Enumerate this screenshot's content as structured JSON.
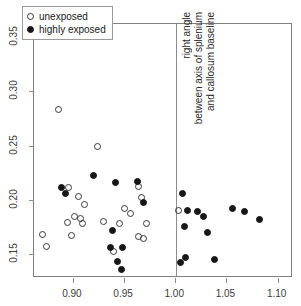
{
  "chart_data": {
    "type": "scatter",
    "title": "",
    "xlabel": "",
    "ylabel": "",
    "xlim": [
      0.862,
      1.115
    ],
    "ylim": [
      0.128,
      0.362
    ],
    "xticks": [
      "0.90",
      "0.95",
      "1.00",
      "1.05",
      "1.10"
    ],
    "xtick_values": [
      0.9,
      0.95,
      1.0,
      1.05,
      1.1
    ],
    "yticks": [
      "0.15",
      "0.20",
      "0.25",
      "0.30",
      "0.35"
    ],
    "ytick_values": [
      0.15,
      0.2,
      0.25,
      0.3,
      0.35
    ],
    "grid": false,
    "legend_position": "top-left",
    "series": [
      {
        "name": "unexposed",
        "marker": "open-circle",
        "color": "#3a3a3a",
        "points": [
          [
            0.886,
            0.283
          ],
          [
            0.924,
            0.249
          ],
          [
            0.896,
            0.211
          ],
          [
            0.905,
            0.203
          ],
          [
            0.911,
            0.196
          ],
          [
            0.902,
            0.185
          ],
          [
            0.907,
            0.183
          ],
          [
            0.909,
            0.178
          ],
          [
            0.895,
            0.179
          ],
          [
            0.93,
            0.18
          ],
          [
            0.946,
            0.178
          ],
          [
            0.964,
            0.212
          ],
          [
            0.967,
            0.202
          ],
          [
            0.95,
            0.192
          ],
          [
            0.956,
            0.187
          ],
          [
            0.964,
            0.166
          ],
          [
            0.969,
            0.164
          ],
          [
            0.972,
            0.178
          ],
          [
            0.87,
            0.168
          ],
          [
            0.874,
            0.157
          ],
          [
            0.899,
            0.167
          ],
          [
            0.94,
            0.152
          ],
          [
            1.003,
            0.19
          ]
        ]
      },
      {
        "name": "highly exposed",
        "marker": "filled-circle",
        "color": "#161616",
        "points": [
          [
            0.889,
            0.211
          ],
          [
            0.893,
            0.206
          ],
          [
            0.92,
            0.222
          ],
          [
            0.942,
            0.216
          ],
          [
            0.963,
            0.217
          ],
          [
            0.969,
            0.198
          ],
          [
            0.939,
            0.172
          ],
          [
            0.937,
            0.156
          ],
          [
            0.948,
            0.156
          ],
          [
            0.944,
            0.143
          ],
          [
            0.947,
            0.136
          ],
          [
            1.007,
            0.206
          ],
          [
            1.012,
            0.19
          ],
          [
            1.009,
            0.175
          ],
          [
            1.022,
            0.189
          ],
          [
            1.028,
            0.185
          ],
          [
            1.031,
            0.17
          ],
          [
            1.056,
            0.192
          ],
          [
            1.068,
            0.189
          ],
          [
            1.082,
            0.182
          ],
          [
            1.01,
            0.147
          ],
          [
            1.005,
            0.142
          ],
          [
            1.038,
            0.145
          ]
        ]
      }
    ],
    "annotations": [
      {
        "name": "vertical-divider",
        "type": "vline",
        "x": 1.0005
      },
      {
        "name": "right-angle-annotation",
        "type": "text-rotated",
        "lines": [
          "right angle",
          "between axis of splenium",
          "and callosum baseline"
        ]
      }
    ]
  },
  "legend": {
    "entries": [
      {
        "label": "unexposed",
        "marker": "open-circle"
      },
      {
        "label": "highly exposed",
        "marker": "filled-circle"
      }
    ]
  }
}
